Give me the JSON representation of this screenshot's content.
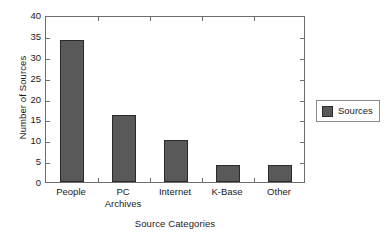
{
  "chart_data": {
    "type": "bar",
    "title": "",
    "xlabel": "Source Categories",
    "ylabel": "Number of Sources",
    "categories": [
      "People",
      "PC\nArchives",
      "Internet",
      "K-Base",
      "Other"
    ],
    "values": [
      34,
      16,
      10,
      4,
      4
    ],
    "series": [
      {
        "name": "Sources",
        "values": [
          34,
          16,
          10,
          4,
          4
        ]
      }
    ],
    "ylim": [
      0,
      40
    ],
    "ytick_step": 5,
    "yticks": [
      0,
      5,
      10,
      15,
      20,
      25,
      30,
      35,
      40
    ],
    "ytick_labels": [
      "0",
      "5",
      "10",
      "15",
      "20",
      "25",
      "30",
      "35",
      "40"
    ],
    "grid": false,
    "legend_position": "right",
    "legend_entries": [
      "Sources"
    ],
    "bar_color": "#595959",
    "bar_edge_color": "#2b2b2b",
    "frame_color": "#6e6e6e",
    "background": "#ffffff"
  },
  "legend": {
    "label": "Sources"
  }
}
